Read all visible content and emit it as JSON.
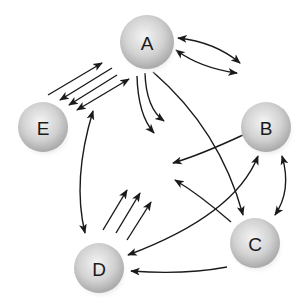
{
  "diagram": {
    "nodes": [
      {
        "id": "A",
        "label": "A",
        "cx": 147,
        "cy": 42,
        "r": 27
      },
      {
        "id": "B",
        "label": "B",
        "cx": 266,
        "cy": 127,
        "r": 25
      },
      {
        "id": "C",
        "label": "C",
        "cx": 255,
        "cy": 243,
        "r": 25
      },
      {
        "id": "D",
        "label": "D",
        "cx": 99,
        "cy": 268,
        "r": 25
      },
      {
        "id": "E",
        "label": "E",
        "cx": 43,
        "cy": 127,
        "r": 25
      }
    ],
    "edges": [
      {
        "name": "edge-a-b-upper",
        "d": "M178 38 Q215 42 240 63",
        "start": true,
        "end": true
      },
      {
        "name": "edge-a-b-lower",
        "d": "M176 50 Q200 68 237 73",
        "start": true,
        "end": true
      },
      {
        "name": "edge-e-a-1",
        "d": "M48 95 L102 63",
        "start": false,
        "end": true
      },
      {
        "name": "edge-a-e-2",
        "d": "M112 68 L60 100",
        "start": false,
        "end": true
      },
      {
        "name": "edge-a-e-3",
        "d": "M117 75 L69 105",
        "start": false,
        "end": true
      },
      {
        "name": "edge-e-a-4",
        "d": "M77 110 L129 79",
        "start": true,
        "end": true
      },
      {
        "name": "edge-a-out-1",
        "d": "M137 76 Q138 115 154 133",
        "start": false,
        "end": true
      },
      {
        "name": "edge-a-out-2",
        "d": "M145 73 Q146 108 164 121",
        "start": false,
        "end": true
      },
      {
        "name": "edge-a-c",
        "d": "M153 72 Q220 130 243 215",
        "start": false,
        "end": true
      },
      {
        "name": "edge-b-out",
        "d": "M243 135 Q200 155 173 163",
        "start": false,
        "end": true
      },
      {
        "name": "edge-c-out",
        "d": "M231 222 Q200 195 175 180",
        "start": false,
        "end": true
      },
      {
        "name": "edge-e-d",
        "d": "M93 111 Q72 180 85 233",
        "start": true,
        "end": true
      },
      {
        "name": "edge-d-out-1",
        "d": "M103 230 L127 190",
        "start": false,
        "end": true
      },
      {
        "name": "edge-d-out-2",
        "d": "M116 233 L140 193",
        "start": false,
        "end": true
      },
      {
        "name": "edge-d-out-3",
        "d": "M127 240 L151 202",
        "start": false,
        "end": true
      },
      {
        "name": "edge-d-b",
        "d": "M128 255 Q235 215 258 156",
        "start": true,
        "end": true
      },
      {
        "name": "edge-c-d",
        "d": "M227 267 Q185 275 131 271",
        "start": false,
        "end": true
      },
      {
        "name": "edge-b-c",
        "d": "M282 156 Q292 190 275 215",
        "start": true,
        "end": true
      }
    ],
    "colors": {
      "sphere_light": "#f2f2f2",
      "sphere_mid": "#cfcfcf",
      "sphere_dark": "#a8a8a8",
      "line": "#1a1a1a",
      "label": "#1a1a1a"
    }
  }
}
